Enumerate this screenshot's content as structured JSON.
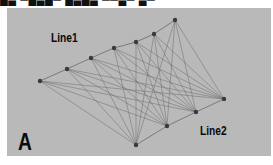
{
  "header": {
    "cutoff_text": "█▄ ▀█▄█▀ █▄█▄ ▀▀▄▀ ▄▀"
  },
  "figure": {
    "panel_label": "A",
    "line1_label": "Line1",
    "line2_label": "Line2",
    "background_color": "#b9b9b9",
    "edge_color": "#6a6a6a",
    "node_color": "#3a3a3a"
  },
  "nodes": {
    "line1": [
      [
        40,
        81
      ],
      [
        67,
        69
      ],
      [
        91,
        58
      ],
      [
        114,
        48
      ],
      [
        136,
        42
      ],
      [
        154,
        34
      ],
      [
        175,
        20
      ]
    ],
    "line2": [
      [
        136,
        145
      ],
      [
        167,
        126
      ],
      [
        196,
        112
      ],
      [
        224,
        99
      ]
    ]
  }
}
